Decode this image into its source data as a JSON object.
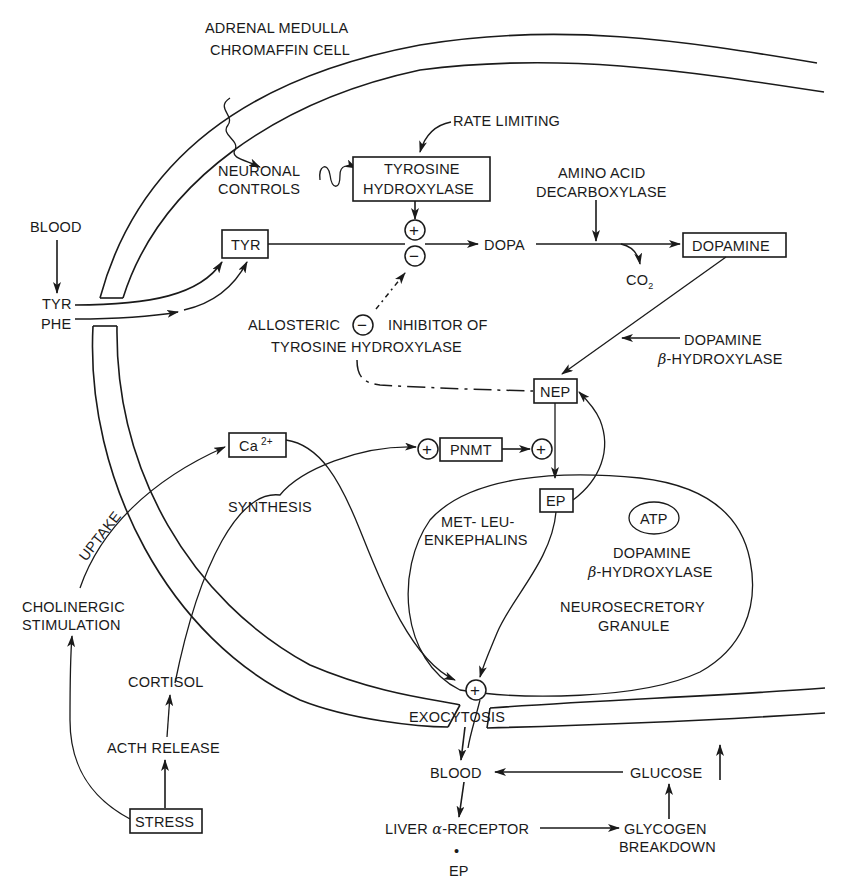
{
  "title": {
    "line1": "ADRENAL MEDULLA",
    "line2": "CHROMAFFIN CELL"
  },
  "colors": {
    "ink": "#1a1a1a",
    "background": "#ffffff"
  },
  "labels": {
    "rate_limiting": "RATE LIMITING",
    "neuronal_controls_1": "NEURONAL",
    "neuronal_controls_2": "CONTROLS",
    "tyrosine_hydroxylase_1": "TYROSINE",
    "tyrosine_hydroxylase_2": "HYDROXYLASE",
    "amino_acid_decarboxylase_1": "AMINO ACID",
    "amino_acid_decarboxylase_2": "DECARBOXYLASE",
    "blood_top": "BLOOD",
    "tyr_box": "TYR",
    "dopa": "DOPA",
    "dopamine_box": "DOPAMINE",
    "co2": "CO",
    "co2_sub": "2",
    "tyr_in": "TYR",
    "phe_in": "PHE",
    "allosteric": "ALLOSTERIC",
    "inhibitor_of": "INHIBITOR OF",
    "tyrosine_hydroxylase_full": "TYROSINE HYDROXYLASE",
    "dbh_1": "DOPAMINE",
    "dbh_2_greek": "β",
    "dbh_2": "-HYDROXYLASE",
    "nep_box": "NEP",
    "ca_box": "Ca",
    "ca_sup": "2+",
    "pnmt_box": "PNMT",
    "synthesis": "SYNTHESIS",
    "uptake": "UPTAKE",
    "ep_box": "EP",
    "met_leu_1": "MET- LEU-",
    "met_leu_2": "ENKEPHALINS",
    "atp": "ATP",
    "granule_dbh_1": "DOPAMINE",
    "granule_dbh_2_greek": "β",
    "granule_dbh_2": "-HYDROXYLASE",
    "neurosecretory_1": "NEUROSECRETORY",
    "neurosecretory_2": "GRANULE",
    "cholinergic_1": "CHOLINERGIC",
    "cholinergic_2": "STIMULATION",
    "cortisol": "CORTISOL",
    "acth_release": "ACTH RELEASE",
    "stress_box": "STRESS",
    "exocytosis": "EXOCYTOSIS",
    "blood_bottom": "BLOOD",
    "glucose": "GLUCOSE",
    "liver_1": "LIVER ",
    "liver_greek": "α",
    "liver_2": "-RECEPTOR",
    "liver_dot": "•",
    "liver_ep": "EP",
    "glycogen_1": "GLYCOGEN",
    "glycogen_2": "BREAKDOWN"
  },
  "symbols": {
    "plus": "+",
    "minus": "−"
  },
  "icons": {
    "arrowhead": "filled-triangle-arrow",
    "squiggle": "wavy-nerve-line",
    "glucose_increase": "up-arrow-icon"
  }
}
